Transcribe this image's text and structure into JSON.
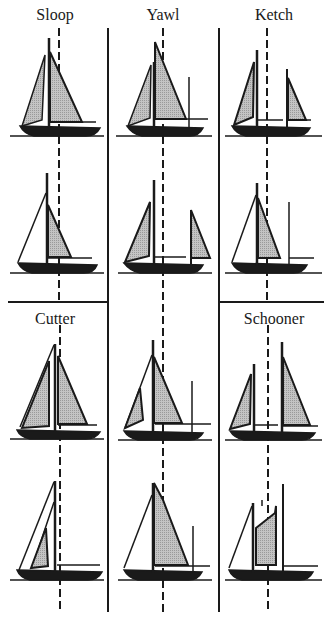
{
  "figure": {
    "rig_labels": {
      "sloop": "Sloop",
      "yawl": "Yawl",
      "ketch": "Ketch",
      "cutter": "Cutter",
      "schooner": "Schooner"
    },
    "colors": {
      "ink": "#1a1a1a",
      "sail_shade": "#b8b8b8",
      "background": "#ffffff"
    },
    "layout": {
      "columns": 3,
      "rows": 4,
      "column_dividers_x": [
        108,
        219
      ],
      "row_divider_y": 302
    }
  }
}
